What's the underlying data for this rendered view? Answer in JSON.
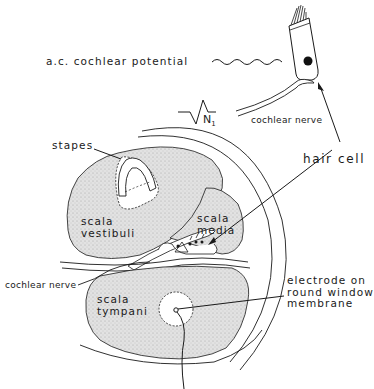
{
  "figure": {
    "type": "anatomical diagram",
    "colors": {
      "ink": "#1a1a1a",
      "stipple_fill": "#dcdcdc",
      "background": "#ffffff"
    }
  },
  "labels": {
    "ac_potential": "a.c. cochlear potential",
    "n1": "N",
    "n1_sub": "1",
    "cochlear_nerve_top": "cochlear nerve",
    "stapes": "stapes",
    "hair_cell": "hair cell",
    "scala_vestibuli": "scala\nvestibuli",
    "scala_media": "scala\nmedia",
    "cochlear_nerve_left": "cochlear nerve",
    "electrode": "electrode on\nround window\nmembrane",
    "scala_tympani": "scala\ntympani"
  }
}
